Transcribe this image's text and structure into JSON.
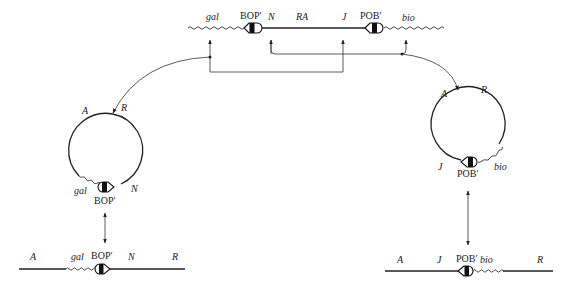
{
  "diagram": {
    "type": "lambda-phage-excision-integration",
    "top": {
      "labels": {
        "gal": "gal",
        "bop": "BOP′",
        "n": "N",
        "ra": "RA",
        "j": "J",
        "pob": "POB′",
        "bio": "bio"
      }
    },
    "left_circle": {
      "labels": {
        "a": "A",
        "r": "R",
        "gal": "gal",
        "bop": "BOP′",
        "n": "N"
      }
    },
    "right_circle": {
      "labels": {
        "a": "A",
        "r": "R",
        "j": "J",
        "pob": "POB′",
        "bio": "bio"
      }
    },
    "bottom_left": {
      "labels": {
        "a": "A",
        "gal": "gal",
        "bop": "BOP′",
        "n": "N",
        "r": "R"
      }
    },
    "bottom_right": {
      "labels": {
        "a": "A",
        "j": "J",
        "pob": "POB′",
        "bio": "bio",
        "r": "R"
      }
    }
  }
}
